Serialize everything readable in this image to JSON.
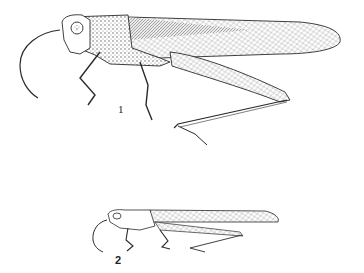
{
  "figures": [
    {
      "id": 1,
      "label": "1",
      "subject": "grasshopper, lateral view (large)"
    },
    {
      "id": 2,
      "label": "2",
      "subject": "grasshopper, lateral view (small)"
    }
  ],
  "colors": {
    "ink": "#2a2a2a",
    "paper": "#ffffff",
    "shade": "#7a7a7a"
  }
}
